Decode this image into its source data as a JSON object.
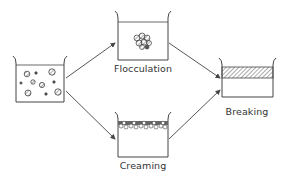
{
  "diagram": {
    "nodes": [
      {
        "id": "emulsion",
        "label": ""
      },
      {
        "id": "flocculation",
        "label": "Flocculation"
      },
      {
        "id": "creaming",
        "label": "Creaming"
      },
      {
        "id": "breaking",
        "label": "Breaking"
      }
    ],
    "edges": [
      {
        "from": "emulsion",
        "to": "flocculation"
      },
      {
        "from": "emulsion",
        "to": "creaming"
      },
      {
        "from": "flocculation",
        "to": "breaking"
      },
      {
        "from": "creaming",
        "to": "breaking"
      }
    ],
    "colors": {
      "line": "#444444",
      "background": "#ffffff"
    }
  }
}
